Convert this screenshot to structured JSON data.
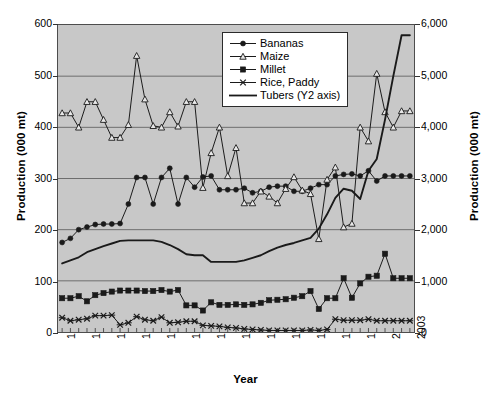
{
  "chart_data": {
    "type": "line",
    "title": "",
    "xlabel": "Year",
    "ylabel": "Production (000 mt)",
    "y2label": "Production (000 mt)",
    "grid": true,
    "legend_position": "top-center-inside",
    "plot_background": "#c8c8c8",
    "line_color": "#1a1a1a",
    "x": [
      1961,
      1962,
      1963,
      1964,
      1965,
      1966,
      1967,
      1968,
      1969,
      1970,
      1971,
      1972,
      1973,
      1974,
      1975,
      1976,
      1977,
      1978,
      1979,
      1980,
      1981,
      1982,
      1983,
      1984,
      1985,
      1986,
      1987,
      1988,
      1989,
      1990,
      1991,
      1992,
      1993,
      1994,
      1995,
      1996,
      1997,
      1998,
      1999,
      2000,
      2001,
      2002,
      2003
    ],
    "xtick_labels": [
      "1961",
      "1964",
      "1967",
      "1970",
      "1973",
      "1976",
      "1979",
      "1982",
      "1985",
      "1988",
      "1991",
      "1994",
      "1997",
      "2000",
      "2003"
    ],
    "xtick_values": [
      1961,
      1964,
      1967,
      1970,
      1973,
      1976,
      1979,
      1982,
      1985,
      1988,
      1991,
      1994,
      1997,
      2000,
      2003
    ],
    "xlim": [
      1960.5,
      2003.5
    ],
    "ylim": [
      0,
      600
    ],
    "ytick_labels": [
      "0",
      "100",
      "200",
      "300",
      "400",
      "500",
      "600"
    ],
    "ytick_values": [
      0,
      100,
      200,
      300,
      400,
      500,
      600
    ],
    "y2lim": [
      0,
      6000
    ],
    "y2tick_labels": [
      "0",
      "1,000",
      "2,000",
      "3,000",
      "4,000",
      "5,000",
      "6,000"
    ],
    "y2tick_values": [
      0,
      1000,
      2000,
      3000,
      4000,
      5000,
      6000
    ],
    "series": [
      {
        "name": "Bananas",
        "axis": "y1",
        "marker": "filled-circle",
        "values": [
          175,
          183,
          200,
          205,
          210,
          211,
          211,
          212,
          250,
          302,
          302,
          250,
          302,
          320,
          250,
          302,
          283,
          303,
          305,
          278,
          278,
          278,
          281,
          272,
          275,
          283,
          285,
          285,
          275,
          275,
          281,
          288,
          288,
          305,
          308,
          309,
          305,
          315,
          295,
          305,
          305,
          305,
          305
        ]
      },
      {
        "name": "Maize",
        "axis": "y1",
        "marker": "open-triangle",
        "values": [
          428,
          428,
          400,
          450,
          450,
          415,
          380,
          380,
          405,
          540,
          455,
          403,
          400,
          430,
          402,
          450,
          450,
          282,
          350,
          400,
          305,
          360,
          252,
          252,
          275,
          265,
          252,
          280,
          303,
          277,
          270,
          182,
          298,
          322,
          205,
          212,
          400,
          373,
          505,
          430,
          400,
          432,
          432
        ]
      },
      {
        "name": "Millet",
        "axis": "y1",
        "marker": "filled-square",
        "values": [
          66,
          66,
          70,
          60,
          72,
          76,
          79,
          81,
          81,
          81,
          80,
          80,
          82,
          79,
          82,
          52,
          52,
          42,
          58,
          53,
          53,
          54,
          53,
          54,
          57,
          62,
          63,
          64,
          67,
          70,
          80,
          45,
          66,
          66,
          105,
          67,
          95,
          108,
          110,
          153,
          105,
          105,
          105
        ]
      },
      {
        "name": "Rice, Paddy",
        "axis": "y1",
        "marker": "x-cross",
        "values": [
          28,
          22,
          24,
          26,
          32,
          32,
          33,
          14,
          18,
          30,
          24,
          22,
          29,
          18,
          19,
          21,
          21,
          13,
          12,
          11,
          9,
          8,
          6,
          5,
          4,
          3,
          3,
          3,
          3,
          3,
          4,
          3,
          5,
          25,
          23,
          23,
          23,
          25,
          22,
          22,
          22,
          22,
          22
        ]
      },
      {
        "name": "Tubers (Y2 axis)",
        "axis": "y2",
        "marker": "none",
        "values": [
          1340,
          1400,
          1460,
          1560,
          1620,
          1680,
          1730,
          1780,
          1790,
          1790,
          1790,
          1790,
          1760,
          1700,
          1620,
          1520,
          1500,
          1500,
          1370,
          1370,
          1370,
          1370,
          1400,
          1450,
          1500,
          1580,
          1650,
          1700,
          1740,
          1790,
          1840,
          2020,
          2300,
          2620,
          2800,
          2760,
          2600,
          3150,
          3380,
          4150,
          5000,
          5800,
          5800
        ]
      }
    ]
  },
  "legend": {
    "items": [
      {
        "label": "Bananas",
        "marker": "filled-circle"
      },
      {
        "label": "Maize",
        "marker": "open-triangle"
      },
      {
        "label": "Millet",
        "marker": "filled-square"
      },
      {
        "label": "Rice, Paddy",
        "marker": "x-cross"
      },
      {
        "label": "Tubers (Y2 axis)",
        "marker": "plain-line"
      }
    ]
  },
  "axes": {
    "y1_title": "Production (000 mt)",
    "y2_title": "Production (000 mt)",
    "x_title": "Year"
  }
}
